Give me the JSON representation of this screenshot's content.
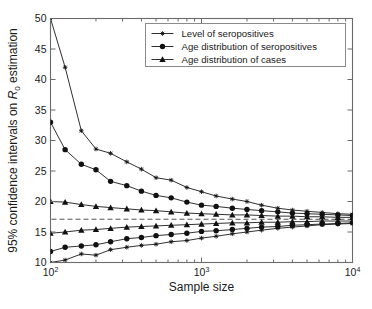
{
  "chart_data": {
    "type": "line",
    "title": "",
    "xlabel": "Sample size",
    "ylabel": "95% confidence intervals on R_0 estimation",
    "ylabel_parts": {
      "prefix": "95% confidence intervals on ",
      "symbol": "R",
      "subscript": "0",
      "suffix": " estimation"
    },
    "xscale": "log",
    "yscale": "linear",
    "xlim": [
      100,
      10000
    ],
    "ylim": [
      10,
      50
    ],
    "grid": false,
    "xticks": [
      100,
      1000,
      10000
    ],
    "xtick_labels": [
      "10^2",
      "10^3",
      "10^4"
    ],
    "xtick_mantissa": [
      "10",
      "10",
      "10"
    ],
    "xtick_exponent": [
      "2",
      "3",
      "4"
    ],
    "yticks": [
      10,
      15,
      20,
      25,
      30,
      35,
      40,
      45,
      50
    ],
    "ytick_labels": [
      "10",
      "15",
      "20",
      "25",
      "30",
      "35",
      "40",
      "45",
      "50"
    ],
    "reference_line": {
      "label": "true R_0",
      "value": 17.1,
      "style": "dashed"
    },
    "legend_position": "top-right",
    "legend": [
      {
        "label": "Level of seropositives",
        "marker": "star"
      },
      {
        "label": "Age distribution of seropositives",
        "marker": "circle"
      },
      {
        "label": "Age distribution of cases",
        "marker": "triangle"
      }
    ],
    "x": [
      100,
      125,
      160,
      200,
      250,
      320,
      400,
      500,
      630,
      800,
      1000,
      1250,
      1600,
      2000,
      2500,
      3200,
      4000,
      5000,
      6300,
      8000,
      10000
    ],
    "series": [
      {
        "name": "Level of seropositives upper",
        "marker": "star",
        "bound": "upper",
        "values": [
          50.0,
          42.0,
          31.6,
          28.6,
          27.9,
          26.5,
          25.3,
          23.9,
          23.5,
          22.3,
          21.6,
          20.9,
          20.4,
          20.0,
          19.4,
          18.9,
          18.6,
          18.4,
          18.2,
          18.0,
          17.9
        ]
      },
      {
        "name": "Level of seropositives lower",
        "marker": "star",
        "bound": "lower",
        "values": [
          10.0,
          10.4,
          11.4,
          11.2,
          12.1,
          12.5,
          12.8,
          13.0,
          13.4,
          13.6,
          14.0,
          14.3,
          14.7,
          15.0,
          15.3,
          15.6,
          15.8,
          16.0,
          16.2,
          16.3,
          16.4
        ]
      },
      {
        "name": "Age distribution of seropositives upper",
        "marker": "circle",
        "bound": "upper",
        "values": [
          33.0,
          28.5,
          26.1,
          25.2,
          23.3,
          22.6,
          21.7,
          21.0,
          20.6,
          19.9,
          19.4,
          19.2,
          18.9,
          18.7,
          18.5,
          18.3,
          18.1,
          18.0,
          17.9,
          17.8,
          17.7
        ]
      },
      {
        "name": "Age distribution of seropositives lower",
        "marker": "circle",
        "bound": "lower",
        "values": [
          11.8,
          12.5,
          12.7,
          12.9,
          13.4,
          13.9,
          14.1,
          14.4,
          14.6,
          14.8,
          15.1,
          15.2,
          15.4,
          15.6,
          15.8,
          15.9,
          16.1,
          16.2,
          16.3,
          16.4,
          16.5
        ]
      },
      {
        "name": "Age distribution of cases upper",
        "marker": "triangle",
        "bound": "upper",
        "values": [
          20.0,
          19.9,
          19.5,
          19.2,
          19.0,
          18.8,
          18.6,
          18.5,
          18.3,
          18.1,
          18.0,
          17.9,
          17.8,
          17.8,
          17.7,
          17.6,
          17.6,
          17.5,
          17.5,
          17.4,
          17.4
        ]
      },
      {
        "name": "Age distribution of cases lower",
        "marker": "triangle",
        "bound": "lower",
        "values": [
          14.8,
          15.0,
          15.3,
          15.4,
          15.6,
          15.8,
          15.9,
          16.0,
          16.1,
          16.2,
          16.3,
          16.4,
          16.5,
          16.5,
          16.6,
          16.6,
          16.7,
          16.7,
          16.8,
          16.8,
          16.8
        ]
      }
    ]
  },
  "axes": {
    "x_title": "Sample size",
    "y_title_prefix": "95% confidence intervals on ",
    "y_title_symbol": "R",
    "y_title_sub": "0",
    "y_title_suffix": " estimation"
  },
  "legend": {
    "items": [
      "Level of seropositives",
      "Age distribution of seropositives",
      "Age distribution of cases"
    ]
  },
  "colors": {
    "line": "#1a1a1a",
    "axis": "#6b6b6b",
    "reference": "#555555",
    "background": "#ffffff"
  }
}
